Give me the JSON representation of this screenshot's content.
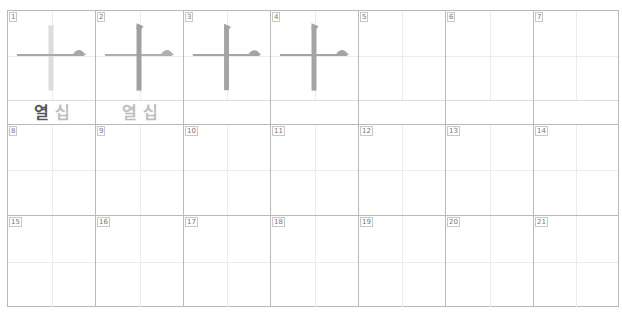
{
  "character": "十",
  "readings": {
    "meaning": "열",
    "sound": "십"
  },
  "colors": {
    "stroke_active": "#9a9a9a",
    "stroke_inactive": "#cfcfcf",
    "grid_border": "#b9b9b9",
    "guide_line": "#ececec",
    "reading_strong": "#555555",
    "reading_light": "#bdbdbd"
  },
  "rows": [
    {
      "cells": [
        {
          "number": "1",
          "stroke_state": "horizontal-active",
          "label": {
            "meaning": "열",
            "sound": "십",
            "meaning_style": "strong"
          }
        },
        {
          "number": "2",
          "stroke_state": "vertical-active",
          "label": {
            "meaning": "열",
            "sound": "십",
            "meaning_style": "light"
          }
        },
        {
          "number": "3",
          "stroke_state": "full"
        },
        {
          "number": "4",
          "stroke_state": "full"
        },
        {
          "number": "5"
        },
        {
          "number": "6"
        },
        {
          "number": "7"
        }
      ]
    },
    {
      "cells": [
        {
          "number": "8"
        },
        {
          "number": "9"
        },
        {
          "number": "10"
        },
        {
          "number": "11"
        },
        {
          "number": "12"
        },
        {
          "number": "13"
        },
        {
          "number": "14"
        }
      ]
    },
    {
      "cells": [
        {
          "number": "15"
        },
        {
          "number": "16"
        },
        {
          "number": "17"
        },
        {
          "number": "18"
        },
        {
          "number": "19"
        },
        {
          "number": "20"
        },
        {
          "number": "21"
        }
      ]
    }
  ]
}
